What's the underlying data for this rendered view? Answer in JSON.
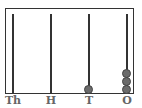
{
  "diagram": {
    "type": "abacus",
    "rods": [
      {
        "label": "Th",
        "beads": 0
      },
      {
        "label": "H",
        "beads": 0
      },
      {
        "label": "T",
        "beads": 1
      },
      {
        "label": "O",
        "beads": 3
      }
    ],
    "colors": {
      "frame": "#333333",
      "bead": "#6b6b6b",
      "label": "#666666"
    }
  }
}
